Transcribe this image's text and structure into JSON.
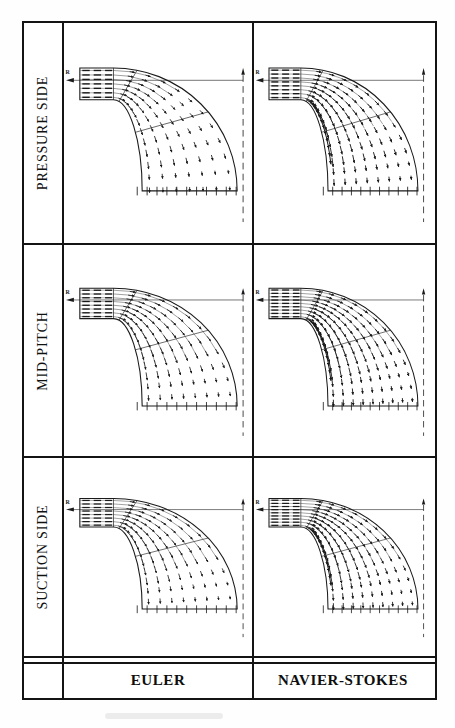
{
  "figure": {
    "axis": {
      "radial_label": "R"
    },
    "row_labels": [
      "PRESSURE SIDE",
      "MID-PITCH",
      "SUCTION SIDE"
    ],
    "column_labels": [
      "EULER",
      "NAVIER-STOKES"
    ],
    "panels": [
      {
        "row": "PRESSURE SIDE",
        "column": "EULER",
        "variant": "euler-pressure"
      },
      {
        "row": "PRESSURE SIDE",
        "column": "NAVIER-STOKES",
        "variant": "ns-pressure"
      },
      {
        "row": "MID-PITCH",
        "column": "EULER",
        "variant": "euler-mid"
      },
      {
        "row": "MID-PITCH",
        "column": "NAVIER-STOKES",
        "variant": "ns-mid"
      },
      {
        "row": "SUCTION SIDE",
        "column": "EULER",
        "variant": "euler-suction"
      },
      {
        "row": "SUCTION SIDE",
        "column": "NAVIER-STOKES",
        "variant": "ns-suction"
      }
    ],
    "colors": {
      "ink": "#1a1a1a",
      "paper": "#ffffff"
    }
  }
}
